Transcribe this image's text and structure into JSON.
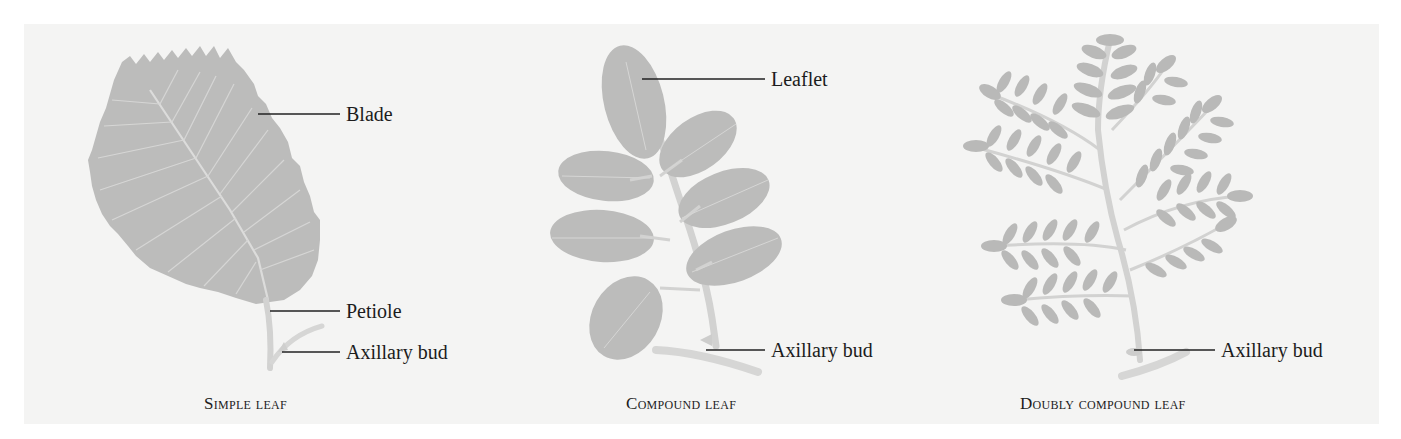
{
  "figure": {
    "panels": [
      {
        "id": "simple",
        "caption": "Simple leaf",
        "labels": [
          "Blade",
          "Petiole",
          "Axillary bud"
        ]
      },
      {
        "id": "compound",
        "caption": "Compound leaf",
        "labels": [
          "Leaflet",
          "Axillary bud"
        ]
      },
      {
        "id": "doubly",
        "caption": "Doubly compound leaf",
        "labels": [
          "Axillary bud"
        ]
      }
    ],
    "colors": {
      "background": "#f4f4f3",
      "leaf": "#b9b9b8",
      "vein": "#dcdcdb",
      "stem": "#d2d2d1",
      "text": "#1c1c1c"
    }
  }
}
